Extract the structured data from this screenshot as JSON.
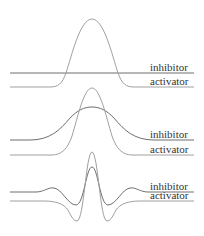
{
  "colors": {
    "inhibitor": "#6e6e6e",
    "activator": "#a0a0a0",
    "text": "#333333"
  },
  "panels": [
    {
      "inhibitor_label": "inhibitor",
      "activator_label": "activator"
    },
    {
      "inhibitor_label": "inhibitor",
      "activator_label": "activator"
    },
    {
      "inhibitor_label": "inhibitor",
      "activator_label": "activator"
    }
  ]
}
